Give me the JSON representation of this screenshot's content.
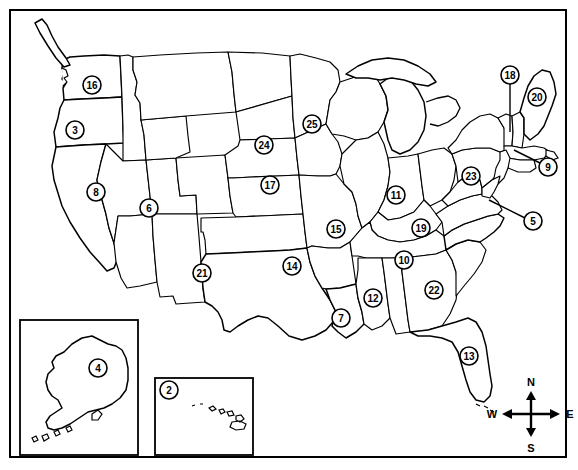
{
  "map": {
    "title": "United States numbered state map",
    "frame": {
      "border_color": "#000000"
    },
    "markers": [
      {
        "id": "marker-2",
        "number": "2",
        "region": "hawaii",
        "x": 169,
        "y": 390,
        "leader": null
      },
      {
        "id": "marker-3",
        "number": "3",
        "region": "oregon",
        "x": 75,
        "y": 130,
        "leader": null
      },
      {
        "id": "marker-4",
        "number": "4",
        "region": "alaska",
        "x": 98,
        "y": 368,
        "leader": null
      },
      {
        "id": "marker-5",
        "number": "5",
        "region": "delaware",
        "x": 533,
        "y": 221,
        "leader": {
          "x2": 488,
          "y2": 201
        }
      },
      {
        "id": "marker-6",
        "number": "6",
        "region": "utah",
        "x": 149,
        "y": 208,
        "leader": null
      },
      {
        "id": "marker-7",
        "number": "7",
        "region": "louisiana",
        "x": 341,
        "y": 318,
        "leader": null
      },
      {
        "id": "marker-8",
        "number": "8",
        "region": "nevada",
        "x": 96,
        "y": 192,
        "leader": null
      },
      {
        "id": "marker-9",
        "number": "9",
        "region": "rhode-island",
        "x": 548,
        "y": 167,
        "leader": {
          "x2": 516,
          "y2": 149
        }
      },
      {
        "id": "marker-10",
        "number": "10",
        "region": "alabama",
        "x": 404,
        "y": 260,
        "leader": null
      },
      {
        "id": "marker-11",
        "number": "11",
        "region": "indiana",
        "x": 396,
        "y": 195,
        "leader": null
      },
      {
        "id": "marker-12",
        "number": "12",
        "region": "mississippi",
        "x": 373,
        "y": 298,
        "leader": null
      },
      {
        "id": "marker-13",
        "number": "13",
        "region": "florida",
        "x": 469,
        "y": 356,
        "leader": null
      },
      {
        "id": "marker-14",
        "number": "14",
        "region": "oklahoma",
        "x": 292,
        "y": 266,
        "leader": null
      },
      {
        "id": "marker-15",
        "number": "15",
        "region": "missouri",
        "x": 336,
        "y": 229,
        "leader": null
      },
      {
        "id": "marker-16",
        "number": "16",
        "region": "washington",
        "x": 92,
        "y": 85,
        "leader": null
      },
      {
        "id": "marker-17",
        "number": "17",
        "region": "nebraska",
        "x": 270,
        "y": 185,
        "leader": null
      },
      {
        "id": "marker-18",
        "number": "18",
        "region": "new-hampshire",
        "x": 510,
        "y": 75,
        "leader": {
          "x2": 510,
          "y2": 130
        }
      },
      {
        "id": "marker-19",
        "number": "19",
        "region": "kentucky",
        "x": 421,
        "y": 228,
        "leader": null
      },
      {
        "id": "marker-20",
        "number": "20",
        "region": "maine",
        "x": 537,
        "y": 97,
        "leader": null
      },
      {
        "id": "marker-21",
        "number": "21",
        "region": "new-mexico",
        "x": 202,
        "y": 273,
        "leader": null
      },
      {
        "id": "marker-22",
        "number": "22",
        "region": "georgia",
        "x": 434,
        "y": 290,
        "leader": null
      },
      {
        "id": "marker-23",
        "number": "23",
        "region": "pennsylvania",
        "x": 471,
        "y": 176,
        "leader": null
      },
      {
        "id": "marker-24",
        "number": "24",
        "region": "south-dakota",
        "x": 264,
        "y": 145,
        "leader": null
      },
      {
        "id": "marker-25",
        "number": "25",
        "region": "minnesota",
        "x": 312,
        "y": 124,
        "leader": null
      }
    ],
    "insets": [
      {
        "id": "inset-alaska",
        "name": "alaska-inset-box",
        "x": 20,
        "y": 320,
        "w": 118,
        "h": 135
      },
      {
        "id": "inset-hawaii",
        "name": "hawaii-inset-box",
        "x": 155,
        "y": 378,
        "w": 98,
        "h": 77
      }
    ],
    "compass": {
      "name": "compass-rose",
      "center_x": 531,
      "center_y": 414,
      "north": "N",
      "south": "S",
      "east": "E",
      "west": "W"
    }
  }
}
